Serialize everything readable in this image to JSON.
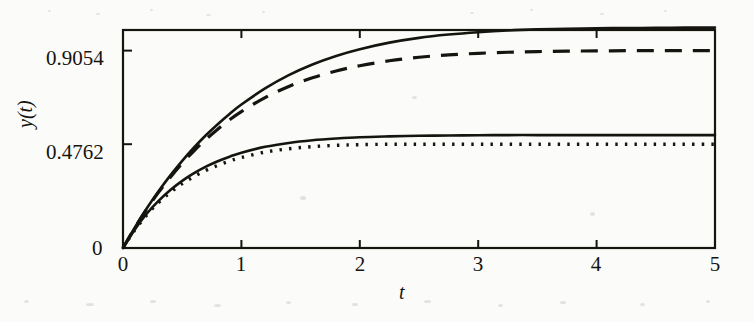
{
  "chart_data": {
    "type": "line",
    "title": "",
    "xlabel": "t",
    "ylabel": "y(t)",
    "xlim": [
      0,
      5
    ],
    "ylim": [
      0,
      1.0
    ],
    "grid": false,
    "legend": "none",
    "xticks": [
      "0",
      "1",
      "2",
      "3",
      "4",
      "5"
    ],
    "xtick_values": [
      0,
      1,
      2,
      3,
      4,
      5
    ],
    "yticks": [
      "0",
      "0.4762",
      "0.9054"
    ],
    "ytick_values": [
      0,
      0.4762,
      0.9054
    ],
    "series": [
      {
        "name": "solid-upper",
        "style": "solid",
        "color": "#15140f",
        "x": [
          0,
          0.1,
          0.2,
          0.3,
          0.4,
          0.5,
          0.6,
          0.7,
          0.8,
          0.9,
          1.0,
          1.2,
          1.4,
          1.6,
          1.8,
          2.0,
          2.25,
          2.5,
          2.75,
          3.0,
          3.25,
          3.5,
          3.75,
          4.0,
          4.25,
          4.5,
          4.75,
          5.0
        ],
        "y": [
          0,
          0.094,
          0.181,
          0.26,
          0.333,
          0.4,
          0.461,
          0.517,
          0.568,
          0.615,
          0.658,
          0.732,
          0.793,
          0.842,
          0.881,
          0.912,
          0.942,
          0.964,
          0.979,
          0.99,
          0.998,
          1.003,
          1.006,
          1.008,
          1.009,
          1.01,
          1.011,
          1.011
        ]
      },
      {
        "name": "dashed-upper",
        "style": "dashed",
        "color": "#15140f",
        "x": [
          0,
          0.1,
          0.2,
          0.3,
          0.4,
          0.5,
          0.6,
          0.7,
          0.8,
          0.9,
          1.0,
          1.2,
          1.4,
          1.6,
          1.8,
          2.0,
          2.25,
          2.5,
          2.75,
          3.0,
          3.25,
          3.5,
          3.75,
          4.0,
          4.25,
          4.5,
          4.75,
          5.0
        ],
        "y": [
          0,
          0.093,
          0.178,
          0.255,
          0.325,
          0.389,
          0.446,
          0.498,
          0.545,
          0.588,
          0.626,
          0.69,
          0.741,
          0.781,
          0.812,
          0.836,
          0.859,
          0.875,
          0.886,
          0.893,
          0.898,
          0.901,
          0.903,
          0.904,
          0.905,
          0.905,
          0.905,
          0.905
        ]
      },
      {
        "name": "solid-lower",
        "style": "solid",
        "color": "#15140f",
        "x": [
          0,
          0.1,
          0.2,
          0.3,
          0.4,
          0.5,
          0.6,
          0.7,
          0.8,
          0.9,
          1.0,
          1.2,
          1.4,
          1.6,
          1.8,
          2.0,
          2.25,
          2.5,
          2.75,
          3.0,
          3.25,
          3.5,
          3.75,
          4.0,
          4.25,
          4.5,
          4.75,
          5.0
        ],
        "y": [
          0,
          0.085,
          0.157,
          0.216,
          0.266,
          0.308,
          0.343,
          0.373,
          0.398,
          0.419,
          0.437,
          0.464,
          0.482,
          0.494,
          0.502,
          0.508,
          0.512,
          0.515,
          0.516,
          0.517,
          0.518,
          0.518,
          0.518,
          0.518,
          0.518,
          0.518,
          0.518,
          0.518
        ]
      },
      {
        "name": "dotted-lower",
        "style": "dotted",
        "color": "#15140f",
        "x": [
          0,
          0.1,
          0.2,
          0.3,
          0.4,
          0.5,
          0.6,
          0.7,
          0.8,
          0.9,
          1.0,
          1.2,
          1.4,
          1.6,
          1.8,
          2.0,
          2.25,
          2.5,
          2.75,
          3.0,
          3.25,
          3.5,
          3.75,
          4.0,
          4.25,
          4.5,
          4.75,
          5.0
        ],
        "y": [
          0,
          0.082,
          0.151,
          0.208,
          0.255,
          0.295,
          0.328,
          0.356,
          0.379,
          0.399,
          0.415,
          0.44,
          0.455,
          0.465,
          0.471,
          0.474,
          0.476,
          0.476,
          0.476,
          0.476,
          0.476,
          0.476,
          0.476,
          0.476,
          0.476,
          0.476,
          0.476,
          0.476
        ]
      }
    ]
  },
  "axes": {
    "x_title": "t",
    "y_title": "y(t)"
  }
}
